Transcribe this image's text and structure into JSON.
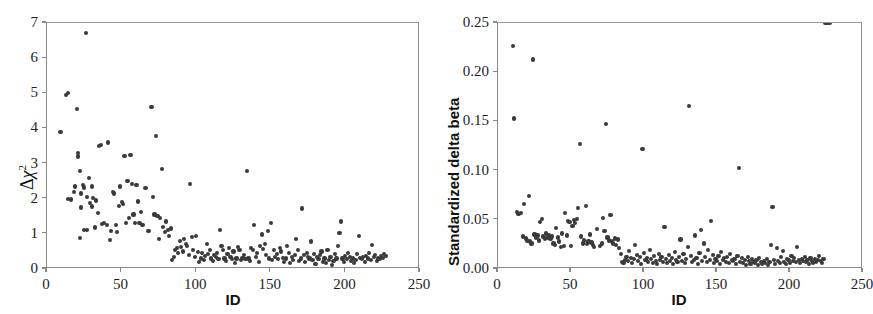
{
  "figure": {
    "panels": [
      "diagnostics-delta-chisq",
      "diagnostics-delta-beta"
    ]
  },
  "chart_data": [
    {
      "id": "left",
      "type": "scatter",
      "title": "",
      "xlabel": "ID",
      "ylabel": "Δχ²",
      "ylabel_parts": {
        "delta": "Δ",
        "chi": "χ",
        "exp": "2"
      },
      "xlim": [
        0,
        250
      ],
      "ylim": [
        0,
        7
      ],
      "xticks": [
        0,
        50,
        100,
        150,
        200,
        250
      ],
      "xticklabels": [
        "0",
        "50",
        "100",
        "150",
        "200",
        "250"
      ],
      "yticks": [
        0,
        1,
        2,
        3,
        4,
        5,
        6,
        7
      ],
      "yticklabels": [
        "0",
        "1",
        "2",
        "3",
        "4",
        "5",
        "6",
        "7"
      ],
      "grid": false,
      "legend": false,
      "marker_color": "#3a3a3a",
      "marker_size": 4.2,
      "x": [
        9,
        13,
        14,
        14,
        16,
        18,
        19,
        20,
        21,
        21,
        22,
        22,
        23,
        23,
        24,
        25,
        25,
        26,
        27,
        27,
        28,
        29,
        30,
        30,
        31,
        32,
        33,
        34,
        35,
        36,
        37,
        38,
        40,
        41,
        42,
        43,
        44,
        45,
        46,
        47,
        48,
        49,
        50,
        51,
        52,
        53,
        54,
        55,
        56,
        57,
        58,
        59,
        60,
        61,
        62,
        63,
        64,
        66,
        68,
        70,
        71,
        72,
        73,
        74,
        75,
        76,
        77,
        78,
        79,
        80,
        81,
        82,
        83,
        84,
        85,
        86,
        87,
        88,
        89,
        90,
        91,
        92,
        93,
        94,
        95,
        96,
        97,
        98,
        99,
        100,
        101,
        102,
        103,
        104,
        105,
        106,
        107,
        108,
        109,
        110,
        111,
        112,
        113,
        114,
        115,
        116,
        117,
        118,
        119,
        120,
        121,
        122,
        123,
        124,
        125,
        126,
        127,
        128,
        129,
        130,
        131,
        132,
        133,
        134,
        135,
        136,
        137,
        138,
        139,
        140,
        141,
        142,
        143,
        144,
        145,
        146,
        147,
        148,
        149,
        150,
        151,
        152,
        153,
        154,
        155,
        156,
        157,
        158,
        159,
        160,
        161,
        162,
        163,
        164,
        165,
        166,
        167,
        168,
        169,
        170,
        171,
        172,
        173,
        174,
        175,
        176,
        177,
        178,
        179,
        180,
        181,
        182,
        183,
        184,
        185,
        186,
        187,
        188,
        189,
        190,
        191,
        192,
        193,
        194,
        195,
        196,
        197,
        198,
        199,
        200,
        201,
        202,
        203,
        204,
        205,
        206,
        207,
        208,
        209,
        210,
        211,
        212,
        213,
        214,
        215,
        216,
        217,
        218,
        219,
        220,
        221,
        222,
        223,
        224,
        225,
        226,
        227
      ],
      "y": [
        3.9,
        4.95,
        5.0,
        2.0,
        1.98,
        2.2,
        2.35,
        4.55,
        3.3,
        3.2,
        0.88,
        2.78,
        2.15,
        1.75,
        2.4,
        2.32,
        1.1,
        6.72,
        2.05,
        1.12,
        2.6,
        1.88,
        2.35,
        1.78,
        2.02,
        1.18,
        1.95,
        1.6,
        3.5,
        3.52,
        1.28,
        1.3,
        1.25,
        3.6,
        0.82,
        1.08,
        2.2,
        2.15,
        1.25,
        1.05,
        1.8,
        2.35,
        1.9,
        1.85,
        3.22,
        1.3,
        2.5,
        1.45,
        3.25,
        2.42,
        1.55,
        1.3,
        2.4,
        1.92,
        1.3,
        1.62,
        1.25,
        2.3,
        1.08,
        4.62,
        2.05,
        1.55,
        3.78,
        1.5,
        0.85,
        1.45,
        2.85,
        1.2,
        1.05,
        1.35,
        1.1,
        0.95,
        1.15,
        0.25,
        0.35,
        0.55,
        0.6,
        0.45,
        0.8,
        0.62,
        0.5,
        0.85,
        0.72,
        0.65,
        0.4,
        2.42,
        0.9,
        0.55,
        0.35,
        0.95,
        0.48,
        0.2,
        0.3,
        0.45,
        0.25,
        0.38,
        0.7,
        0.42,
        0.55,
        0.3,
        0.22,
        0.4,
        0.35,
        0.45,
        0.28,
        1.12,
        0.65,
        0.55,
        0.3,
        0.22,
        0.42,
        0.6,
        0.35,
        0.28,
        0.5,
        0.18,
        0.3,
        0.62,
        0.55,
        0.25,
        0.32,
        0.4,
        0.28,
        2.78,
        0.3,
        0.22,
        0.6,
        0.55,
        1.25,
        0.35,
        0.45,
        0.2,
        0.65,
        0.98,
        0.58,
        0.72,
        0.4,
        1.08,
        0.3,
        1.3,
        0.25,
        0.55,
        0.35,
        0.42,
        0.28,
        0.6,
        0.5,
        0.32,
        0.2,
        0.3,
        0.65,
        0.45,
        0.18,
        0.35,
        0.25,
        0.4,
        0.85,
        0.55,
        0.22,
        0.3,
        1.72,
        0.4,
        0.2,
        0.45,
        0.35,
        0.3,
        0.78,
        0.25,
        0.42,
        0.15,
        0.35,
        0.28,
        0.4,
        0.5,
        0.2,
        0.3,
        0.18,
        0.55,
        0.25,
        0.35,
        0.12,
        0.22,
        0.42,
        0.3,
        0.65,
        1.02,
        1.35,
        0.3,
        0.2,
        0.38,
        0.28,
        0.45,
        0.35,
        0.22,
        0.3,
        0.18,
        0.25,
        0.42,
        0.95,
        0.32,
        0.28,
        0.35,
        0.2,
        0.38,
        0.3,
        0.45,
        0.25,
        0.68,
        0.35,
        0.4,
        0.22,
        0.3,
        0.28,
        0.36,
        0.32,
        0.42,
        0.38,
        0.3,
        0.25,
        0.92,
        0.35,
        0.28,
        0.22,
        0.4,
        0.3,
        0.24
      ]
    },
    {
      "id": "right",
      "type": "scatter",
      "title": "",
      "xlabel": "ID",
      "ylabel": "Standardized delta beta",
      "xlim": [
        0,
        250
      ],
      "ylim": [
        0,
        0.25
      ],
      "xticks": [
        0,
        50,
        100,
        150,
        200,
        250
      ],
      "xticklabels": [
        "0",
        "50",
        "100",
        "150",
        "200",
        "250"
      ],
      "yticks": [
        0.0,
        0.05,
        0.1,
        0.15,
        0.2,
        0.25
      ],
      "yticklabels": [
        "0.00",
        "0.05",
        "0.10",
        "0.15",
        "0.20",
        "0.25"
      ],
      "grid": false,
      "legend": false,
      "marker_color": "#3a3a3a",
      "marker_size": 4.2,
      "x": [
        10,
        11,
        13,
        14,
        16,
        17,
        18,
        19,
        20,
        21,
        22,
        23,
        24,
        25,
        26,
        27,
        28,
        29,
        30,
        31,
        32,
        33,
        34,
        35,
        36,
        37,
        38,
        39,
        40,
        41,
        42,
        43,
        44,
        45,
        46,
        47,
        48,
        49,
        50,
        51,
        52,
        53,
        54,
        55,
        56,
        57,
        58,
        59,
        60,
        61,
        62,
        63,
        64,
        65,
        66,
        68,
        70,
        71,
        72,
        73,
        74,
        75,
        76,
        77,
        78,
        79,
        80,
        81,
        82,
        83,
        84,
        85,
        86,
        87,
        88,
        89,
        90,
        91,
        92,
        93,
        94,
        95,
        96,
        97,
        98,
        99,
        100,
        101,
        102,
        103,
        104,
        105,
        106,
        107,
        108,
        109,
        110,
        111,
        112,
        113,
        114,
        115,
        116,
        117,
        118,
        119,
        120,
        121,
        122,
        123,
        124,
        125,
        126,
        127,
        128,
        129,
        130,
        131,
        132,
        133,
        134,
        135,
        136,
        137,
        138,
        139,
        140,
        141,
        142,
        143,
        144,
        145,
        146,
        147,
        148,
        149,
        150,
        151,
        152,
        153,
        154,
        155,
        156,
        157,
        158,
        159,
        160,
        161,
        162,
        163,
        164,
        165,
        166,
        167,
        168,
        169,
        170,
        171,
        172,
        173,
        174,
        175,
        176,
        177,
        178,
        179,
        180,
        181,
        182,
        183,
        184,
        185,
        186,
        187,
        188,
        189,
        190,
        191,
        192,
        193,
        194,
        195,
        196,
        197,
        198,
        199,
        200,
        201,
        202,
        203,
        204,
        205,
        206,
        207,
        208,
        209,
        210,
        211,
        212,
        213,
        214,
        215,
        216,
        217,
        218,
        219,
        220,
        221,
        222,
        223,
        224,
        225,
        226,
        227
      ],
      "y": [
        0.227,
        0.153,
        0.058,
        0.056,
        0.057,
        0.033,
        0.066,
        0.031,
        0.029,
        0.074,
        0.028,
        0.026,
        0.213,
        0.035,
        0.032,
        0.034,
        0.029,
        0.048,
        0.051,
        0.033,
        0.031,
        0.036,
        0.032,
        0.034,
        0.031,
        0.033,
        0.026,
        0.024,
        0.042,
        0.032,
        0.028,
        0.022,
        0.036,
        0.023,
        0.057,
        0.034,
        0.049,
        0.048,
        0.023,
        0.044,
        0.05,
        0.047,
        0.051,
        0.062,
        0.127,
        0.033,
        0.026,
        0.029,
        0.064,
        0.025,
        0.028,
        0.035,
        0.027,
        0.024,
        0.022,
        0.041,
        0.023,
        0.026,
        0.052,
        0.039,
        0.147,
        0.032,
        0.029,
        0.055,
        0.028,
        0.026,
        0.031,
        0.024,
        0.03,
        0.021,
        0.015,
        0.007,
        0.006,
        0.009,
        0.012,
        0.008,
        0.018,
        0.011,
        0.006,
        0.01,
        0.024,
        0.014,
        0.008,
        0.012,
        0.005,
        0.122,
        0.016,
        0.009,
        0.011,
        0.007,
        0.019,
        0.01,
        0.006,
        0.013,
        0.008,
        0.005,
        0.015,
        0.009,
        0.012,
        0.007,
        0.043,
        0.01,
        0.006,
        0.014,
        0.008,
        0.011,
        0.005,
        0.017,
        0.009,
        0.007,
        0.012,
        0.03,
        0.008,
        0.015,
        0.006,
        0.01,
        0.022,
        0.166,
        0.013,
        0.007,
        0.009,
        0.034,
        0.011,
        0.005,
        0.016,
        0.04,
        0.008,
        0.026,
        0.012,
        0.007,
        0.019,
        0.009,
        0.049,
        0.014,
        0.006,
        0.01,
        0.008,
        0.013,
        0.005,
        0.017,
        0.009,
        0.011,
        0.007,
        0.012,
        0.006,
        0.015,
        0.009,
        0.008,
        0.01,
        0.005,
        0.013,
        0.103,
        0.007,
        0.011,
        0.006,
        0.009,
        0.004,
        0.012,
        0.008,
        0.005,
        0.01,
        0.007,
        0.006,
        0.009,
        0.004,
        0.011,
        0.007,
        0.005,
        0.008,
        0.006,
        0.01,
        0.004,
        0.007,
        0.024,
        0.063,
        0.009,
        0.005,
        0.021,
        0.008,
        0.006,
        0.012,
        0.018,
        0.007,
        0.005,
        0.01,
        0.009,
        0.006,
        0.013,
        0.008,
        0.011,
        0.007,
        0.022,
        0.009,
        0.006,
        0.01,
        0.008,
        0.012,
        0.007,
        0.009,
        0.005,
        0.011,
        0.008,
        0.006,
        0.01,
        0.007,
        0.009,
        0.013,
        0.008,
        0.006,
        0.01
      ]
    }
  ]
}
